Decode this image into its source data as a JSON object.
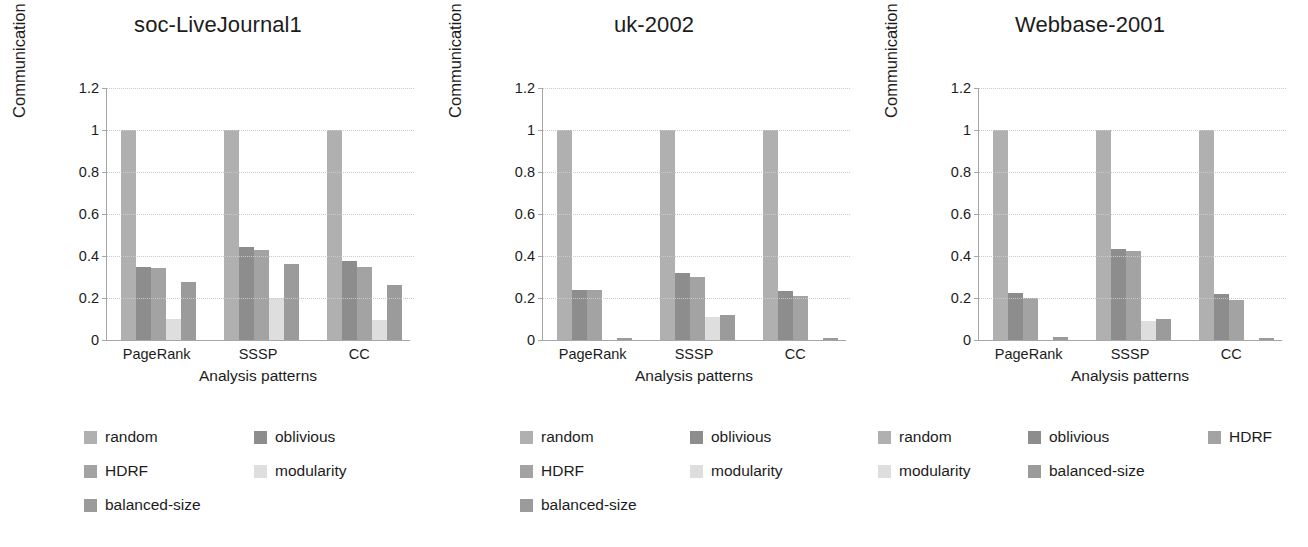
{
  "figure": {
    "series_names": [
      "random",
      "oblivious",
      "HDRF",
      "modularity",
      "balanced-size"
    ],
    "series_colors": [
      "#b0b0b0",
      "#8d8d8d",
      "#a3a3a3",
      "#dedede",
      "#9b9b9b"
    ],
    "yticks": [
      "1.2",
      "1",
      "0.8",
      "0.6",
      "0.4",
      "0.2",
      "0"
    ],
    "ylabel": "Communication cost (random=1)",
    "xlabel": "Analysis patterns",
    "categories": [
      "PageRank",
      "SSSP",
      "CC"
    ]
  },
  "chart_data": [
    {
      "type": "bar",
      "title": "soc-LiveJournal1",
      "xlabel": "Analysis patterns",
      "ylabel": "Communication cost (random=1)",
      "categories": [
        "PageRank",
        "SSSP",
        "CC"
      ],
      "ylim": [
        0,
        1.2
      ],
      "ytick_values": [
        0,
        0.2,
        0.4,
        0.6,
        0.8,
        1,
        1.2
      ],
      "grid": true,
      "legend_position": "below",
      "series": [
        {
          "name": "random",
          "values": [
            1.0,
            1.0,
            1.0
          ]
        },
        {
          "name": "oblivious",
          "values": [
            0.35,
            0.445,
            0.375
          ]
        },
        {
          "name": "HDRF",
          "values": [
            0.345,
            0.43,
            0.35
          ]
        },
        {
          "name": "modularity",
          "values": [
            0.1,
            0.2,
            0.095
          ]
        },
        {
          "name": "balanced-size",
          "values": [
            0.275,
            0.36,
            0.26
          ]
        }
      ]
    },
    {
      "type": "bar",
      "title": "uk-2002",
      "xlabel": "Analysis patterns",
      "ylabel": "Communication cost (random=1)",
      "categories": [
        "PageRank",
        "SSSP",
        "CC"
      ],
      "ylim": [
        0,
        1.2
      ],
      "ytick_values": [
        0,
        0.2,
        0.4,
        0.6,
        0.8,
        1,
        1.2
      ],
      "grid": true,
      "legend_position": "below",
      "series": [
        {
          "name": "random",
          "values": [
            1.0,
            1.0,
            1.0
          ]
        },
        {
          "name": "oblivious",
          "values": [
            0.24,
            0.32,
            0.235
          ]
        },
        {
          "name": "HDRF",
          "values": [
            0.24,
            0.3,
            0.21
          ]
        },
        {
          "name": "modularity",
          "values": [
            0.0,
            0.11,
            0.0
          ]
        },
        {
          "name": "balanced-size",
          "values": [
            0.01,
            0.12,
            0.01
          ]
        }
      ]
    },
    {
      "type": "bar",
      "title": "Webbase-2001",
      "xlabel": "Analysis patterns",
      "ylabel": "Communication cost (random=1)",
      "categories": [
        "PageRank",
        "SSSP",
        "CC"
      ],
      "ylim": [
        0,
        1.2
      ],
      "ytick_values": [
        0,
        0.2,
        0.4,
        0.6,
        0.8,
        1,
        1.2
      ],
      "grid": true,
      "legend_position": "below",
      "series": [
        {
          "name": "random",
          "values": [
            1.0,
            1.0,
            1.0
          ]
        },
        {
          "name": "oblivious",
          "values": [
            0.225,
            0.435,
            0.22
          ]
        },
        {
          "name": "HDRF",
          "values": [
            0.2,
            0.425,
            0.19
          ]
        },
        {
          "name": "modularity",
          "values": [
            0.0,
            0.09,
            0.0
          ]
        },
        {
          "name": "balanced-size",
          "values": [
            0.012,
            0.1,
            0.008
          ]
        }
      ]
    }
  ]
}
